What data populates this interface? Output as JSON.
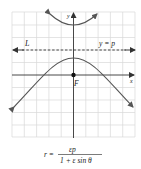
{
  "diagram": {
    "type": "conic-section-hyperbola-polar",
    "grid": {
      "cols": 10,
      "rows": 10,
      "color": "#d6d6d6"
    },
    "axes": {
      "x_label": "x",
      "y_label": "y",
      "color": "#333333"
    },
    "focus": {
      "label": "F"
    },
    "directrix": {
      "label_left": "L",
      "label_right": "y = p",
      "style": "dashed"
    },
    "curve_color": "#555555",
    "formula": {
      "lhs": "r =",
      "numerator": "εp",
      "denominator": "1 + ε sin θ"
    }
  }
}
